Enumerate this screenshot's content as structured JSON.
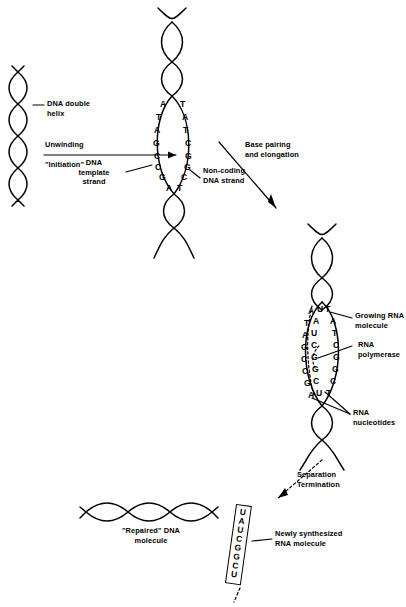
{
  "figure": {
    "background": "#ffffff",
    "ink": "#000000"
  },
  "stages": {
    "initiation": {
      "helix_label": "DNA double\nhelix",
      "arrow_label_top": "Unwinding",
      "arrow_label_bottom": "\"Initiation\"",
      "template_label": "DNA\ntemplate\nstrand",
      "noncoding_label": "Non-coding\nDNA strand",
      "template_bases": [
        "A",
        "T",
        "A",
        "G",
        "C",
        "C",
        "G",
        "A"
      ],
      "noncoding_bases": [
        "T",
        "A",
        "T",
        "C",
        "G",
        "G",
        "C",
        "T"
      ]
    },
    "elongation": {
      "arrow_label": "Base pairing\nand elongation",
      "template_bases": [
        "A",
        "T",
        "A",
        "G",
        "C",
        "C",
        "G",
        "A"
      ],
      "rna_bases": [
        "U",
        "A",
        "U",
        "C",
        "G",
        "G",
        "C",
        "U"
      ],
      "noncoding_bases": [
        "T",
        "A",
        "T",
        "C",
        "G",
        "G",
        "C",
        "T"
      ],
      "growing_rna_label": "Growing RNA\nmolecule",
      "polymerase_label": "RNA\npolymerase",
      "nucleotides_label": "RNA\nnucleotides"
    },
    "termination": {
      "arrow_label": "Separation\nTermination",
      "repaired_dna_label": "\"Repaired\" DNA\nmolecule",
      "rna_product_label": "Newly synthesized\nRNA molecule",
      "rna_product_bases": [
        "U",
        "A",
        "U",
        "C",
        "G",
        "G",
        "C",
        "U"
      ]
    }
  }
}
